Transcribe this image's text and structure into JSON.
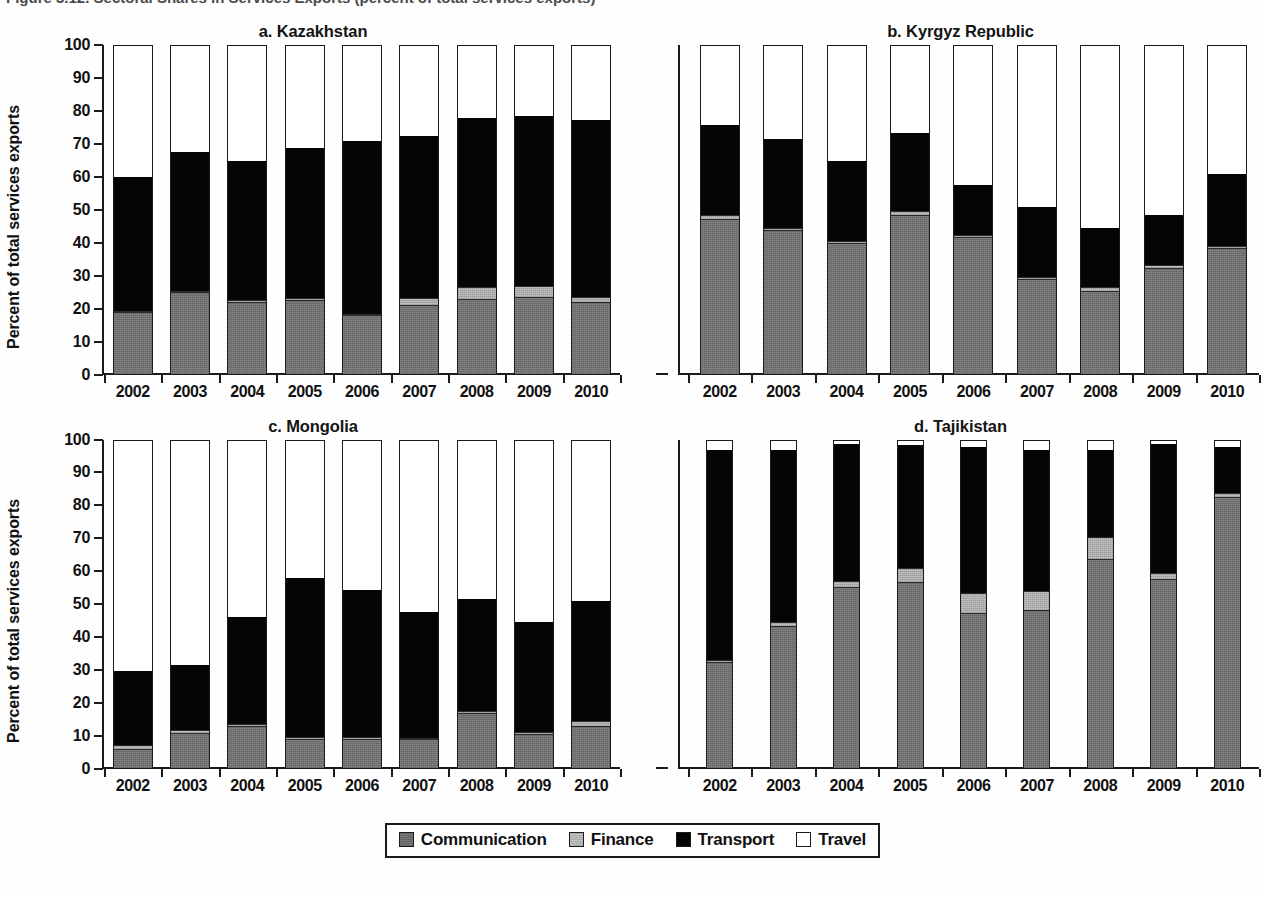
{
  "figure": {
    "caption_partial": "Figure 3.12. Sectoral Shares in Services Exports (percent of total services exports)",
    "ylabel": "Percent of total services exports"
  },
  "legend": {
    "items": [
      {
        "label": "Communication",
        "swatch": "communication-swatch",
        "color": "#787878"
      },
      {
        "label": "Finance",
        "swatch": "finance-swatch",
        "color": "#c3c3c3"
      },
      {
        "label": "Transport",
        "swatch": "transport-swatch",
        "color": "#050505"
      },
      {
        "label": "Travel",
        "swatch": "travel-swatch",
        "color": "#ffffff"
      }
    ]
  },
  "axis": {
    "yticks": [
      0,
      10,
      20,
      30,
      40,
      50,
      60,
      70,
      80,
      90,
      100
    ],
    "ylim": [
      0,
      100
    ],
    "years": [
      "2002",
      "2003",
      "2004",
      "2005",
      "2006",
      "2007",
      "2008",
      "2009",
      "2010"
    ]
  },
  "panels": [
    {
      "id": "a",
      "title": "a. Kazakhstan"
    },
    {
      "id": "b",
      "title": "b. Kyrgyz Republic"
    },
    {
      "id": "c",
      "title": "c. Mongolia"
    },
    {
      "id": "d",
      "title": "d. Tajikistan"
    }
  ],
  "chart_data": {
    "type": "bar",
    "subtype": "stacked-100-percent",
    "title": "Sectoral Shares in Services Exports",
    "xlabel": "",
    "ylabel": "Percent of total services exports",
    "ylim": [
      0,
      100
    ],
    "yticks": [
      0,
      10,
      20,
      30,
      40,
      50,
      60,
      70,
      80,
      90,
      100
    ],
    "grid": false,
    "legend_position": "bottom-center",
    "categories": [
      "2002",
      "2003",
      "2004",
      "2005",
      "2006",
      "2007",
      "2008",
      "2009",
      "2010"
    ],
    "series_order": [
      "Communication",
      "Finance",
      "Transport",
      "Travel"
    ],
    "panels": [
      {
        "id": "a",
        "title": "a. Kazakhstan",
        "series": [
          {
            "name": "Communication",
            "values": [
              18.5,
              24.5,
              21.5,
              22.0,
              17.5,
              20.5,
              22.5,
              23.0,
              21.5
            ]
          },
          {
            "name": "Finance",
            "values": [
              0.5,
              0.8,
              1.0,
              1.0,
              0.6,
              2.5,
              4.0,
              3.8,
              2.0
            ]
          },
          {
            "name": "Transport",
            "values": [
              41.0,
              42.2,
              42.5,
              46.0,
              52.9,
              49.5,
              51.5,
              51.7,
              54.0
            ]
          },
          {
            "name": "Travel",
            "values": [
              40.0,
              32.5,
              35.0,
              31.0,
              29.0,
              27.5,
              22.0,
              21.5,
              22.5
            ]
          }
        ],
        "cumulative_tops": {
          "communication": [
            18.5,
            24.5,
            21.5,
            22.0,
            17.5,
            20.5,
            22.5,
            23.0,
            21.5
          ],
          "finance": [
            19.0,
            25.3,
            22.5,
            23.0,
            18.1,
            23.0,
            26.5,
            26.8,
            23.5
          ],
          "transport": [
            60.0,
            67.5,
            65.0,
            69.0,
            71.0,
            72.5,
            78.0,
            78.5,
            77.5
          ]
        }
      },
      {
        "id": "b",
        "title": "b. Kyrgyz Republic",
        "series": [
          {
            "name": "Communication",
            "values": [
              47.0,
              43.5,
              39.5,
              48.0,
              41.5,
              28.5,
              25.0,
              32.0,
              38.0
            ]
          },
          {
            "name": "Finance",
            "values": [
              1.5,
              1.0,
              1.0,
              1.5,
              0.8,
              1.0,
              1.5,
              1.0,
              1.0
            ]
          },
          {
            "name": "Transport",
            "values": [
              27.5,
              27.0,
              24.5,
              24.0,
              15.2,
              21.5,
              18.0,
              15.5,
              22.0
            ]
          },
          {
            "name": "Travel",
            "values": [
              24.0,
              28.5,
              35.0,
              26.5,
              42.5,
              49.0,
              55.5,
              51.5,
              39.0
            ]
          }
        ],
        "cumulative_tops": {
          "communication": [
            47.0,
            43.5,
            39.5,
            48.0,
            41.5,
            28.5,
            25.0,
            32.0,
            38.0
          ],
          "finance": [
            48.5,
            44.5,
            40.5,
            49.5,
            42.3,
            29.5,
            26.5,
            33.0,
            39.0
          ],
          "transport": [
            76.0,
            71.5,
            65.0,
            73.5,
            57.5,
            51.0,
            44.5,
            48.5,
            61.0
          ]
        }
      },
      {
        "id": "c",
        "title": "c. Mongolia",
        "series": [
          {
            "name": "Communication",
            "values": [
              5.5,
              10.5,
              12.5,
              8.5,
              8.5,
              8.5,
              16.5,
              10.0,
              12.5
            ]
          },
          {
            "name": "Finance",
            "values": [
              1.5,
              1.0,
              1.0,
              1.0,
              1.0,
              0.5,
              1.0,
              1.0,
              2.0
            ]
          },
          {
            "name": "Transport",
            "values": [
              22.5,
              20.0,
              32.5,
              48.5,
              45.0,
              38.5,
              34.0,
              33.5,
              36.5
            ]
          },
          {
            "name": "Travel",
            "values": [
              70.5,
              68.5,
              54.0,
              42.0,
              45.5,
              52.5,
              48.5,
              55.5,
              49.0
            ]
          }
        ],
        "cumulative_tops": {
          "communication": [
            5.5,
            10.5,
            12.5,
            8.5,
            8.5,
            8.5,
            16.5,
            10.0,
            12.5
          ],
          "finance": [
            7.0,
            11.5,
            13.5,
            9.5,
            9.5,
            9.0,
            17.5,
            11.0,
            14.5
          ],
          "transport": [
            29.5,
            31.5,
            46.0,
            58.0,
            54.5,
            47.5,
            51.5,
            44.5,
            51.0
          ]
        }
      },
      {
        "id": "d",
        "title": "d. Tajikistan",
        "series": [
          {
            "name": "Communication",
            "values": [
              32.0,
              43.0,
              55.0,
              56.5,
              47.0,
              48.0,
              63.5,
              57.5,
              82.5
            ]
          },
          {
            "name": "Finance",
            "values": [
              1.0,
              1.5,
              2.0,
              4.5,
              6.5,
              6.0,
              7.0,
              2.0,
              1.5
            ]
          },
          {
            "name": "Transport",
            "values": [
              64.0,
              52.5,
              42.0,
              37.5,
              44.5,
              43.0,
              26.5,
              39.5,
              14.0
            ]
          },
          {
            "name": "Travel",
            "values": [
              3.0,
              3.0,
              1.0,
              1.5,
              2.0,
              3.0,
              3.0,
              1.0,
              2.0
            ]
          }
        ],
        "cumulative_tops": {
          "communication": [
            32.0,
            43.0,
            55.0,
            56.5,
            47.0,
            48.0,
            63.5,
            57.5,
            82.5
          ],
          "finance": [
            33.0,
            44.5,
            57.0,
            61.0,
            53.5,
            54.0,
            70.5,
            59.5,
            84.0
          ],
          "transport": [
            97.0,
            97.0,
            99.0,
            98.5,
            98.0,
            97.0,
            97.0,
            99.0,
            98.0
          ]
        }
      }
    ]
  }
}
